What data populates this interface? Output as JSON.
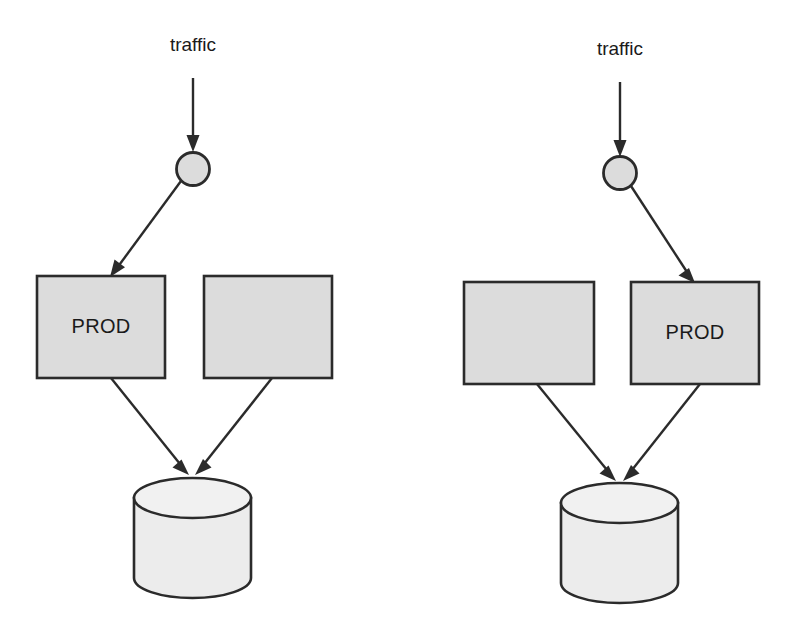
{
  "diagram": {
    "type": "flow-diagram",
    "background_color": "#ffffff",
    "stroke_color": "#2b2b2b",
    "box_fill_color": "#dcdcdc",
    "cylinder_fill_color": "#ececec",
    "groups": [
      {
        "id": "left-group",
        "name": "deployment-state-a",
        "traffic_label": "traffic",
        "router": {
          "name": "router-node",
          "shape": "circle"
        },
        "boxes": [
          {
            "id": "left-group-box-1",
            "label": "PROD",
            "active": true
          },
          {
            "id": "left-group-box-2",
            "label": "",
            "active": false
          }
        ],
        "datastore": {
          "name": "database-cylinder",
          "label": ""
        },
        "edges": [
          {
            "from": "traffic",
            "to": "router-node"
          },
          {
            "from": "router-node",
            "to": "left-group-box-1"
          },
          {
            "from": "left-group-box-1",
            "to": "database-cylinder"
          },
          {
            "from": "left-group-box-2",
            "to": "database-cylinder"
          }
        ]
      },
      {
        "id": "right-group",
        "name": "deployment-state-b",
        "traffic_label": "traffic",
        "router": {
          "name": "router-node",
          "shape": "circle"
        },
        "boxes": [
          {
            "id": "right-group-box-1",
            "label": "",
            "active": false
          },
          {
            "id": "right-group-box-2",
            "label": "PROD",
            "active": true
          }
        ],
        "datastore": {
          "name": "database-cylinder",
          "label": ""
        },
        "edges": [
          {
            "from": "traffic",
            "to": "router-node"
          },
          {
            "from": "router-node",
            "to": "right-group-box-2"
          },
          {
            "from": "right-group-box-1",
            "to": "database-cylinder"
          },
          {
            "from": "right-group-box-2",
            "to": "database-cylinder"
          }
        ]
      }
    ]
  }
}
